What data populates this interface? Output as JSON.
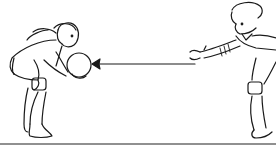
{
  "illustration": {
    "description": "Line drawing of a girl catching a ball thrown by a boy",
    "figures": [
      {
        "id": "girl",
        "role": "catcher",
        "holding": "ball",
        "position": "left"
      },
      {
        "id": "boy",
        "role": "thrower",
        "pose": "arms outstretched",
        "position": "right"
      }
    ],
    "arrow": {
      "direction": "left",
      "meaning": "ball travel direction"
    },
    "colors": {
      "ink": "#1a1a1a",
      "background": "#ffffff"
    }
  }
}
